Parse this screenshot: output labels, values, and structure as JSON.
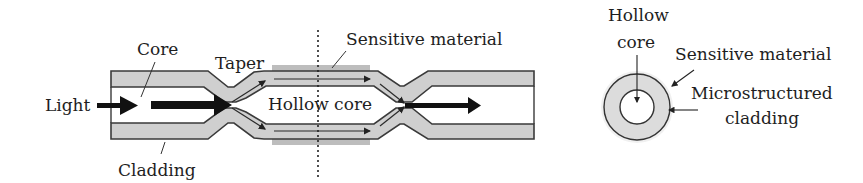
{
  "figure": {
    "left_diagram": {
      "labels": {
        "light": "Light",
        "core": "Core",
        "taper": "Taper",
        "sensitive_material": "Sensitive material",
        "hollow_core": "Hollow core",
        "cladding": "Cladding"
      }
    },
    "right_diagram": {
      "labels": {
        "hollow_line1": "Hollow",
        "hollow_line2": "core",
        "sensitive_material": "Sensitive material",
        "micro_line1": "Microstructured",
        "micro_line2": "cladding"
      }
    },
    "colors": {
      "cladding_fill": "#cfcfcf",
      "outline": "#3a3a3a",
      "arrow": "#111111",
      "sensitive_fill": "#b8b8b8"
    }
  }
}
